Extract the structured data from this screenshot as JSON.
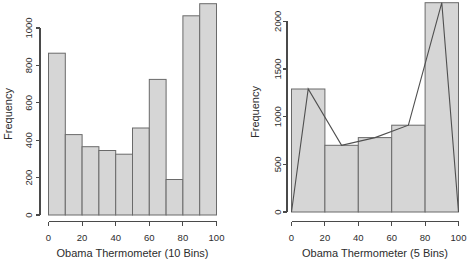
{
  "figure": {
    "background_color": "#ffffff",
    "bar_fill_color": "#d6d6d6",
    "bar_border_color": "#6a6a6a",
    "axis_color": "#4a4a4a",
    "text_color": "#2d2d2d",
    "polygon_color": "#4f4f4f"
  },
  "chart_data": [
    {
      "type": "bar",
      "subtype": "histogram",
      "title": "",
      "xlabel": "Obama Thermometer (10 Bins)",
      "ylabel": "Frequency",
      "bin_width": 10,
      "bin_edges": [
        0,
        10,
        20,
        30,
        40,
        50,
        60,
        70,
        80,
        90,
        100
      ],
      "values": [
        865,
        430,
        365,
        345,
        325,
        465,
        725,
        190,
        1065,
        1130
      ],
      "xticks": [
        0,
        20,
        40,
        60,
        80,
        100
      ],
      "yticks": [
        0,
        200,
        400,
        600,
        800,
        1000
      ],
      "xlim": [
        0,
        100
      ],
      "ylim": [
        0,
        1140
      ],
      "grid": false,
      "legend": false
    },
    {
      "type": "bar",
      "subtype": "histogram-with-frequency-polygon",
      "title": "",
      "xlabel": "Obama Thermometer (5 Bins)",
      "ylabel": "Frequency",
      "bin_width": 20,
      "bin_edges": [
        0,
        20,
        40,
        60,
        80,
        100
      ],
      "values": [
        1290,
        700,
        780,
        910,
        2195
      ],
      "polygon_points": [
        [
          0,
          0
        ],
        [
          10,
          1290
        ],
        [
          30,
          700
        ],
        [
          50,
          780
        ],
        [
          70,
          910
        ],
        [
          90,
          2195
        ],
        [
          100,
          0
        ]
      ],
      "xticks": [
        0,
        20,
        40,
        60,
        80,
        100
      ],
      "yticks": [
        0,
        500,
        1000,
        1500,
        2000
      ],
      "xlim": [
        0,
        100
      ],
      "ylim": [
        0,
        2220
      ],
      "grid": false,
      "legend": false
    }
  ]
}
